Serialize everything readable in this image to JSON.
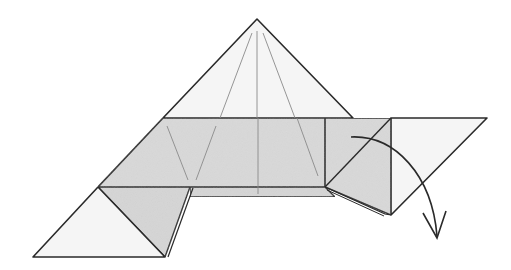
{
  "diagram": {
    "title": "Origami fold step",
    "colors": {
      "paper_light": "#f4f4f4",
      "paper_shaded": "#d9d9d9",
      "outline": "#2a2a2a",
      "crease": "#8a8a8a",
      "arrow": "#2a2a2a"
    },
    "elements": [
      {
        "id": "top-pyramid",
        "label": "Top triangular flap"
      },
      {
        "id": "center-band",
        "label": "Shaded horizontal band"
      },
      {
        "id": "left-triangle",
        "label": "Lower left corner triangle"
      },
      {
        "id": "right-square",
        "label": "Right shaded panel"
      },
      {
        "id": "right-triangle",
        "label": "Right light triangular flap"
      },
      {
        "id": "fold-arrow",
        "label": "Fold down arrow"
      }
    ]
  }
}
